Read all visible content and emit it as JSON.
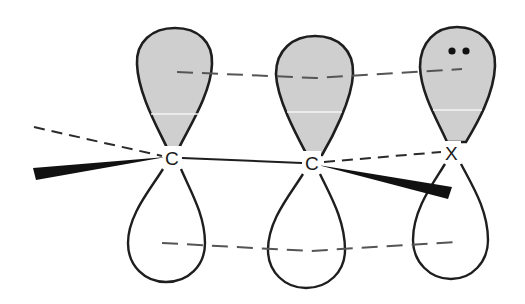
{
  "diagram": {
    "type": "p-orbital overlap (allylic conjugation)",
    "atoms": [
      {
        "label": "C",
        "x": 172,
        "y": 157
      },
      {
        "label": "C",
        "x": 312,
        "y": 162
      },
      {
        "label": "X",
        "x": 452,
        "y": 152
      }
    ],
    "orbitals": [
      {
        "atom": "C",
        "top_lobe": "shaded",
        "bottom_lobe": "unshaded"
      },
      {
        "atom": "C",
        "top_lobe": "shaded",
        "bottom_lobe": "unshaded"
      },
      {
        "atom": "X",
        "top_lobe": "shaded",
        "bottom_lobe": "unshaded",
        "lone_pair": "••"
      }
    ],
    "bonds": [
      {
        "from": "C",
        "to": "C",
        "style": "solid"
      },
      {
        "from": "C",
        "to": "X",
        "style": "dashed"
      },
      {
        "from": "C",
        "to": "substituent-left",
        "style": "wedge"
      },
      {
        "from": "C",
        "to": "substituent-left",
        "style": "dashed"
      },
      {
        "from": "C",
        "to": "substituent-right",
        "style": "wedge"
      }
    ],
    "overlap_lines": [
      "upper lobes dashed",
      "lower lobes dashed"
    ],
    "colors": {
      "shaded_lobe": "#cfcfcf",
      "outline": "#1e1e1e",
      "dash": "#555555",
      "background": "#ffffff"
    }
  },
  "labels": {
    "atom1": "C",
    "atom2": "C",
    "atom3": "X"
  }
}
